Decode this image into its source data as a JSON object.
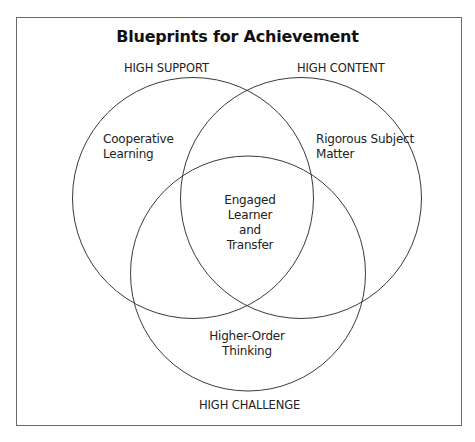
{
  "diagram": {
    "title": "Blueprints for Achievement",
    "circles": [
      {
        "id": "support",
        "caption": "HIGH SUPPORT",
        "label_lines": [
          "Cooperative",
          "Learning"
        ]
      },
      {
        "id": "content",
        "caption": "HIGH CONTENT",
        "label_lines": [
          "Rigorous Subject",
          "Matter"
        ]
      },
      {
        "id": "challenge",
        "caption": "HIGH CHALLENGE",
        "label_lines": [
          "Higher-Order",
          "Thinking"
        ]
      }
    ],
    "intersection": {
      "label_lines": [
        "Engaged",
        "Learner",
        "and",
        "Transfer"
      ]
    },
    "colors": {
      "stroke": "#3a3a3a",
      "frame": "#6a6a6a",
      "text": "#222222"
    }
  }
}
